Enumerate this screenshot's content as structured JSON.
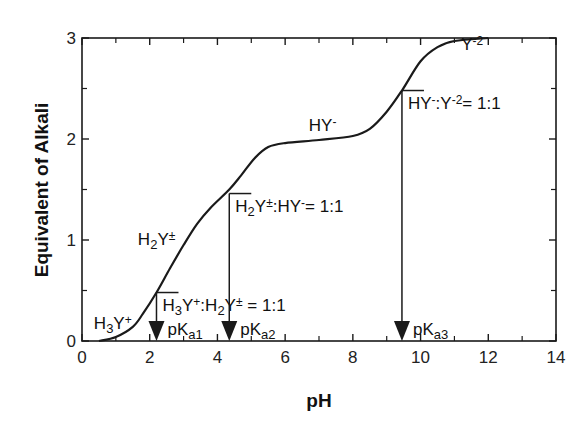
{
  "chart_data": {
    "type": "line",
    "title": "",
    "xlabel": "pH",
    "ylabel": "Equivalent of Alkali",
    "xlim": [
      0,
      14
    ],
    "ylim": [
      0,
      3
    ],
    "grid": false,
    "legend": null,
    "x_ticks": [
      0,
      2,
      4,
      6,
      8,
      10,
      12,
      14
    ],
    "x_minor_ticks": [
      1,
      3,
      5,
      7,
      9,
      11,
      13
    ],
    "y_ticks": [
      0,
      1,
      2,
      3
    ],
    "y_minor_ticks": [
      0.5,
      1.5,
      2.5
    ],
    "series": [
      {
        "name": "Titration curve",
        "points": [
          [
            0.5,
            0.0
          ],
          [
            1.0,
            0.04
          ],
          [
            1.5,
            0.14
          ],
          [
            1.8,
            0.27
          ],
          [
            2.2,
            0.48
          ],
          [
            2.6,
            0.72
          ],
          [
            3.0,
            0.95
          ],
          [
            3.4,
            1.16
          ],
          [
            3.8,
            1.32
          ],
          [
            4.35,
            1.5
          ],
          [
            4.7,
            1.64
          ],
          [
            5.1,
            1.81
          ],
          [
            5.5,
            1.92
          ],
          [
            6.0,
            1.96
          ],
          [
            7.0,
            1.99
          ],
          [
            8.0,
            2.03
          ],
          [
            8.5,
            2.1
          ],
          [
            9.0,
            2.27
          ],
          [
            9.45,
            2.48
          ],
          [
            10.0,
            2.77
          ],
          [
            10.5,
            2.91
          ],
          [
            11.0,
            2.97
          ],
          [
            12.0,
            3.0
          ]
        ]
      }
    ],
    "species_labels": [
      {
        "text": "H3Y+",
        "base": "H",
        "sub": "3",
        "mid": "Y",
        "sup": "+",
        "x": 0.35,
        "y": 0.12
      },
      {
        "text": "H2Y±",
        "base": "H",
        "sub": "2",
        "mid": "Y",
        "sup": "±",
        "x": 1.65,
        "y": 0.95
      },
      {
        "text": "HY-",
        "base": "HY",
        "sub": "",
        "mid": "",
        "sup": "-",
        "x": 6.7,
        "y": 2.08
      },
      {
        "text": "Y-2",
        "base": "Y",
        "sub": "",
        "mid": "",
        "sup": "-2",
        "x": 11.2,
        "y": 2.88
      }
    ],
    "markers": [
      {
        "name": "pKa1",
        "pH": 2.2,
        "y_top": 0.48,
        "ratio_label": "H3Y+:H2Y± = 1:1",
        "pk_label": {
          "base": "pK",
          "sub": "a1"
        }
      },
      {
        "name": "pKa2",
        "pH": 4.35,
        "y_top": 1.46,
        "ratio_label": "H2Y±:HY-= 1:1",
        "pk_label": {
          "base": "pK",
          "sub": "a2"
        }
      },
      {
        "name": "pKa3",
        "pH": 9.45,
        "y_top": 2.48,
        "ratio_label": "HY-:Y-2= 1:1",
        "pk_label": {
          "base": "pK",
          "sub": "a3"
        }
      }
    ],
    "annotations": [
      "H3Y+:H2Y± = 1:1",
      "H2Y±:HY-= 1:1",
      "HY-:Y-2= 1:1",
      "pKa1",
      "pKa2",
      "pKa3"
    ]
  },
  "labels": {
    "xlabel": "pH",
    "ylabel": "Equivalent of Alkali"
  }
}
